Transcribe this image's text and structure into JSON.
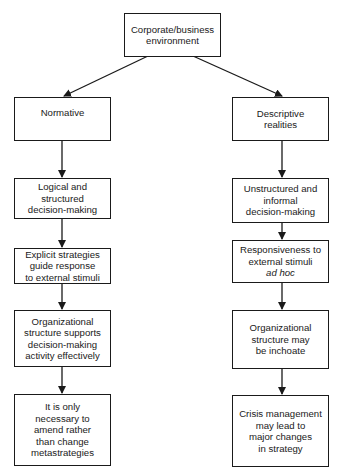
{
  "diagram": {
    "root": {
      "label": "Corporate/business\nenvironment"
    },
    "left_column": {
      "nodes": [
        {
          "label": "Normative"
        },
        {
          "label": "Logical and\nstructured\ndecision-making"
        },
        {
          "label": "Explicit strategies\nguide response\nto external stimuli"
        },
        {
          "label": "Organizational\nstructure supports\ndecision-making\nactivity effectively"
        },
        {
          "label": "It is only\nnecessary to\namend rather\nthan change\nmetastrategies"
        }
      ]
    },
    "right_column": {
      "nodes": [
        {
          "label": "Descriptive\nrealities"
        },
        {
          "label": "Unstructured and\ninformal\ndecision-making"
        },
        {
          "label": "Responsiveness to\nexternal stimuli",
          "italic": "ad hoc"
        },
        {
          "label": "Organizational\nstructure may\nbe inchoate"
        },
        {
          "label": "Crisis management\nmay lead to\nmajor changes\nin strategy"
        }
      ]
    },
    "edges": [
      {
        "from": "Corporate/business environment",
        "to": "Normative"
      },
      {
        "from": "Corporate/business environment",
        "to": "Descriptive realities"
      },
      {
        "from": "Normative",
        "to": "Logical and structured decision-making"
      },
      {
        "from": "Logical and structured decision-making",
        "to": "Explicit strategies guide response to external stimuli"
      },
      {
        "from": "Explicit strategies guide response to external stimuli",
        "to": "Organizational structure supports decision-making activity effectively"
      },
      {
        "from": "Organizational structure supports decision-making activity effectively",
        "to": "It is only necessary to amend rather than change metastrategies"
      },
      {
        "from": "Descriptive realities",
        "to": "Unstructured and informal decision-making"
      },
      {
        "from": "Unstructured and informal decision-making",
        "to": "Responsiveness to external stimuli ad hoc"
      },
      {
        "from": "Responsiveness to external stimuli ad hoc",
        "to": "Organizational structure may be inchoate"
      },
      {
        "from": "Organizational structure may be inchoate",
        "to": "Crisis management may lead to major changes in strategy"
      }
    ]
  }
}
